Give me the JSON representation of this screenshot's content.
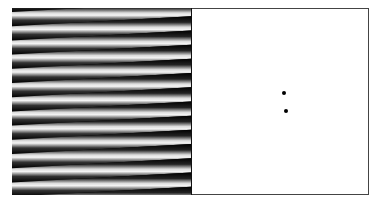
{
  "figure": {
    "left_panel": {
      "kind": "sinusoidal-grating",
      "stripe_count": 13,
      "period_px": 14.2,
      "slope_px_over_width": -10,
      "colors": {
        "dark": "#000000",
        "light": "#ffffff"
      }
    },
    "right_panel": {
      "kind": "fourier-spectrum",
      "background": "#ffffff",
      "dots": [
        {
          "x": 284,
          "y": 93
        },
        {
          "x": 286,
          "y": 111
        }
      ]
    }
  }
}
